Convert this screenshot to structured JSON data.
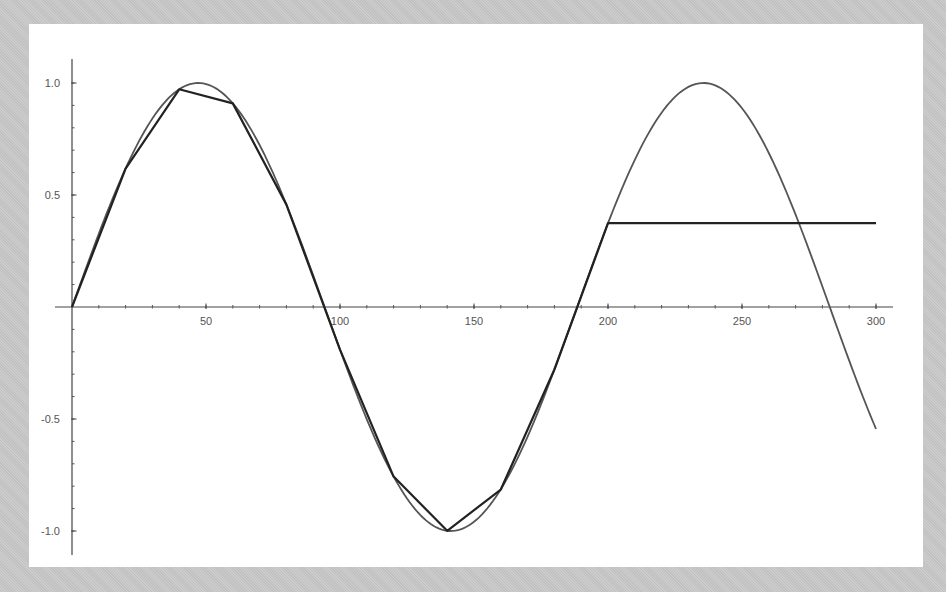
{
  "chart_data": {
    "type": "line",
    "title": "",
    "xlabel": "",
    "ylabel": "",
    "xlim": [
      0,
      306
    ],
    "ylim": [
      -1.1,
      1.1
    ],
    "grid": false,
    "legend": null,
    "x_ticks": [
      50,
      100,
      150,
      200,
      250,
      300
    ],
    "x_tick_labels": [
      "50",
      "100",
      "150",
      "200",
      "250",
      "300"
    ],
    "y_ticks": [
      1.0,
      0.5,
      -0.5,
      -1.0
    ],
    "y_tick_labels": [
      "1.0",
      "0.5",
      "-0.5",
      "-1.0"
    ],
    "x_minor_step": 10,
    "y_minor_step": 0.1,
    "series": [
      {
        "name": "sin(x/30)",
        "style": "smooth curve",
        "color": "#555555",
        "function": "sin(x/30)",
        "x_range": [
          0,
          300
        ],
        "x": [
          0,
          20,
          40,
          60,
          80,
          100,
          120,
          140,
          160,
          180,
          200,
          220,
          240,
          260,
          280,
          300
        ],
        "values": [
          0,
          0.618,
          0.972,
          0.909,
          0.457,
          -0.19,
          -0.757,
          -0.999,
          -0.815,
          -0.279,
          0.374,
          0.862,
          0.992,
          0.701,
          0.103,
          -0.544
        ]
      },
      {
        "name": "sampled approximation",
        "style": "polyline",
        "color": "#222222",
        "x": [
          0,
          20,
          40,
          60,
          80,
          100,
          120,
          140,
          160,
          180,
          200,
          300
        ],
        "values": [
          0,
          0.618,
          0.972,
          0.909,
          0.457,
          -0.19,
          -0.757,
          -0.999,
          -0.815,
          -0.279,
          0.374,
          0.374
        ]
      }
    ]
  }
}
